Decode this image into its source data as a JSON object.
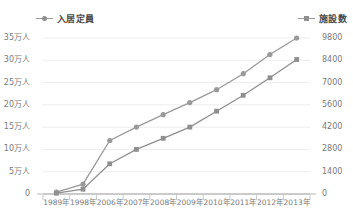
{
  "legend": {
    "left": {
      "label": "入居定員",
      "marker": "circle-marker-icon",
      "color": "#9a9a9a"
    },
    "right": {
      "label": "施設数",
      "marker": "square-marker-icon",
      "color": "#8f8f8f"
    }
  },
  "axes": {
    "left_ticks": [
      "0",
      "5万人",
      "10万人",
      "15万人",
      "20万人",
      "25万人",
      "30万人",
      "35万人"
    ],
    "right_ticks": [
      "0",
      "1400",
      "2800",
      "4200",
      "5600",
      "7000",
      "8400",
      "9800"
    ],
    "x_ticks": [
      "1989年",
      "1998年",
      "2006年",
      "2007年",
      "2008年",
      "2009年",
      "2010年",
      "2011年",
      "2012年",
      "2013年"
    ]
  },
  "chart_data": {
    "type": "line",
    "title": "",
    "xlabel": "",
    "ylabel": "入居定員",
    "y2label": "施設数",
    "grid": true,
    "legend_position": "top",
    "categories": [
      "1989年",
      "1998年",
      "2006年",
      "2007年",
      "2008年",
      "2009年",
      "2010年",
      "2011年",
      "2012年",
      "2013年"
    ],
    "ylim": [
      0,
      350000
    ],
    "y2lim": [
      0,
      9800
    ],
    "yticks": [
      0,
      50000,
      100000,
      150000,
      200000,
      250000,
      300000,
      350000
    ],
    "y2ticks": [
      0,
      1400,
      2800,
      4200,
      5600,
      7000,
      8400,
      9800
    ],
    "series": [
      {
        "name": "入居定員",
        "axis": "left",
        "unit": "人",
        "marker": "circle",
        "color": "#9a9a9a",
        "values": [
          4000,
          22000,
          120000,
          150000,
          178000,
          205000,
          234000,
          270000,
          313000,
          350000
        ]
      },
      {
        "name": "施設数",
        "axis": "right",
        "unit": "施設",
        "marker": "square",
        "color": "#8f8f8f",
        "values": [
          50,
          300,
          1900,
          2800,
          3500,
          4200,
          5200,
          6200,
          7300,
          8450
        ]
      }
    ]
  }
}
